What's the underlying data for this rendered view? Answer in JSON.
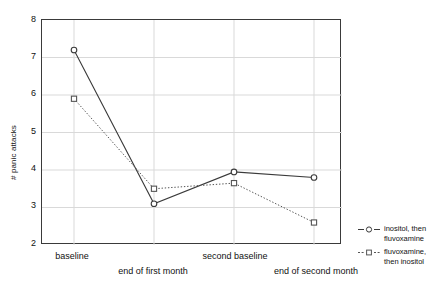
{
  "chart_data": {
    "type": "line",
    "title": "",
    "subtitle": "",
    "xlabel": "",
    "ylabel": "# panic attacks",
    "categories": [
      "baseline",
      "end of first month",
      "second baseline",
      "end of second month"
    ],
    "x": [
      1,
      2,
      3,
      4
    ],
    "xlim": [
      0.6,
      4.35
    ],
    "ylim": [
      2,
      8
    ],
    "y_ticks": [
      2,
      3,
      4,
      5,
      6,
      7,
      8
    ],
    "grid": true,
    "legend_position": "right",
    "series": [
      {
        "name": "inositol, then fluvoxamine",
        "values": [
          7.2,
          3.1,
          3.95,
          3.8
        ],
        "marker": "circle",
        "linestyle": "solid",
        "color": "#3a3a3a"
      },
      {
        "name": "fluvoxamine, then inositol",
        "values": [
          5.9,
          3.5,
          3.65,
          2.6
        ],
        "marker": "square",
        "linestyle": "dotted",
        "color": "#555555"
      }
    ]
  },
  "axes": {
    "y_title": "# panic attacks",
    "y_tick_labels": [
      "8",
      "7",
      "6",
      "5",
      "4",
      "3",
      "2"
    ],
    "x_tick_labels": [
      "baseline",
      "end of first month",
      "second baseline",
      "end of second month"
    ]
  },
  "legend": {
    "entries": [
      {
        "line1": "inositol, then",
        "line2": "fluvoxamine",
        "marker": "circle",
        "linestyle": "solid"
      },
      {
        "line1": "fluvoxamine,",
        "line2": "then inositol",
        "marker": "square",
        "linestyle": "dotted"
      }
    ]
  },
  "colors": {
    "series_1": "#3a3a3a",
    "series_2": "#555555",
    "grid": "#d9d9d9",
    "frame": "#3a3a3a",
    "text": "#111111",
    "background": "#ffffff"
  }
}
